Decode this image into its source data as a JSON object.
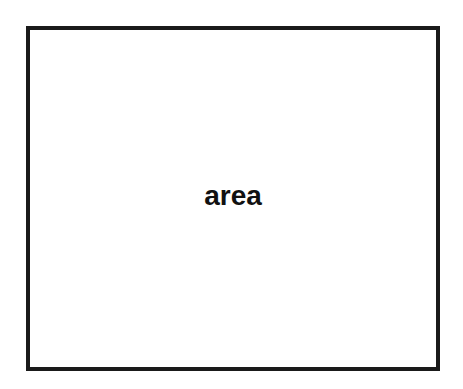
{
  "canvas": {
    "width": 463,
    "height": 389,
    "background_color": "#ffffff"
  },
  "diagram": {
    "type": "single-rectangle-label",
    "shapes": [
      {
        "name": "area-box",
        "shape": "rectangle",
        "label": "area",
        "border_color": "#1a1a1a",
        "border_width": 4,
        "fill_color": "#ffffff",
        "text_color": "#111111",
        "x": 26,
        "y": 26,
        "width": 414,
        "height": 345
      }
    ]
  }
}
